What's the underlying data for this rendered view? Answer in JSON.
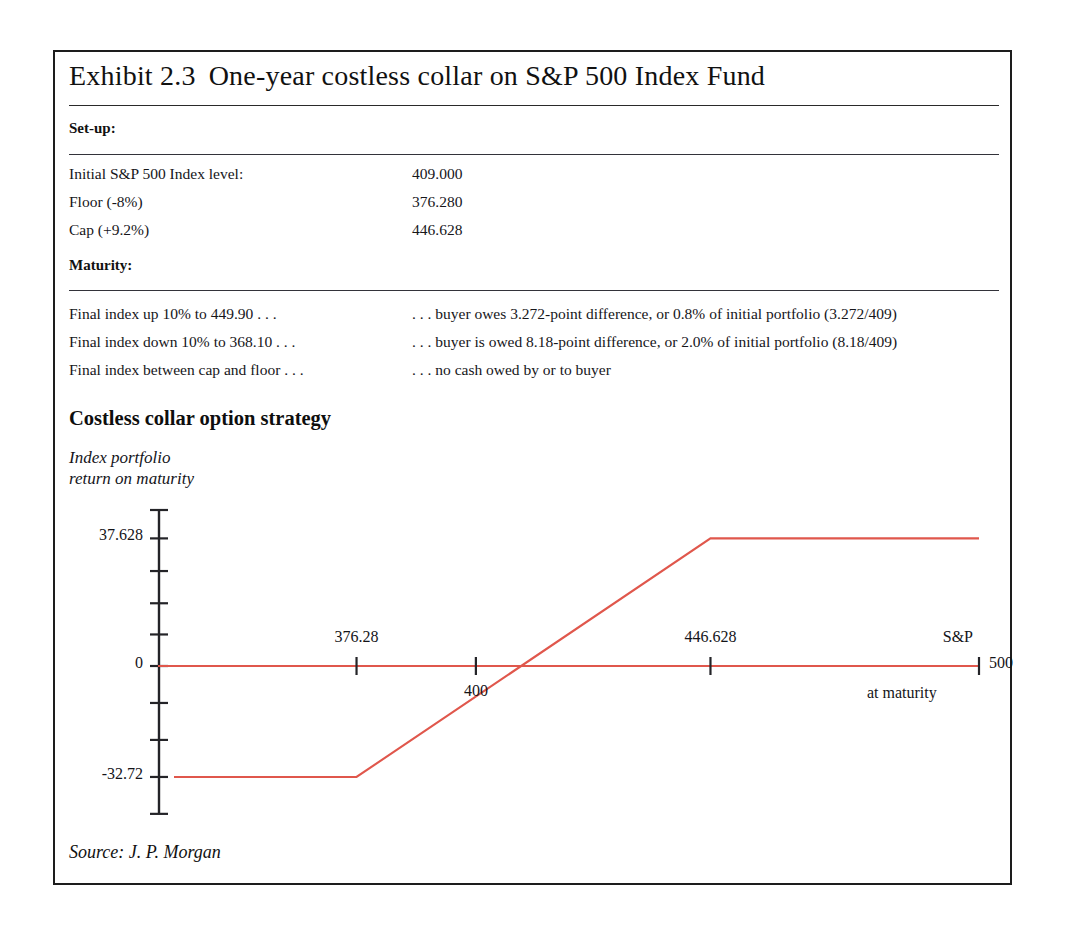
{
  "exhibit": {
    "title_number": "Exhibit 2.3",
    "title_text": "One-year costless collar on S&P 500 Index Fund",
    "source": "Source: J. P. Morgan"
  },
  "setup": {
    "header": "Set-up:",
    "rows": [
      {
        "label": "Initial S&P 500 Index level:",
        "value": "409.000"
      },
      {
        "label": "Floor (-8%)",
        "value": "376.280"
      },
      {
        "label": "Cap (+9.2%)",
        "value": "446.628"
      }
    ]
  },
  "maturity": {
    "header": "Maturity:",
    "rows": [
      {
        "label": "Final index up 10% to 449.90 . . .",
        "value": ". . . buyer owes 3.272-point difference, or 0.8% of initial portfolio (3.272/409)"
      },
      {
        "label": "Final index down 10% to 368.10 . . .",
        "value": ". . . buyer is owed 8.18-point difference, or 2.0% of initial portfolio (8.18/409)"
      },
      {
        "label": "Final index between cap and floor . . .",
        "value": ". . . no cash owed by or to buyer"
      }
    ]
  },
  "chart_data": {
    "type": "line",
    "title": "Costless collar option strategy",
    "ylabel": "Index portfolio\nreturn on maturity",
    "xlabel_lines": [
      "S&P",
      "500",
      "at maturity"
    ],
    "xlabel_tick_value": "500",
    "line_color": "#e0574c",
    "grid": false,
    "legend": null,
    "x": [
      340.0,
      376.28,
      446.628,
      500.0
    ],
    "y": [
      -32.72,
      -32.72,
      37.628,
      37.628
    ],
    "xlim": [
      340.0,
      500.0
    ],
    "ylim": [
      -46.0,
      46.0
    ],
    "x_ticks": [
      {
        "value": 376.28,
        "label": "376.28",
        "label_position": "above"
      },
      {
        "value": 400.0,
        "label": "400",
        "label_position": "below"
      },
      {
        "value": 446.628,
        "label": "446.628",
        "label_position": "above"
      },
      {
        "value": 500.0,
        "label": "500",
        "label_position": "right"
      }
    ],
    "y_ticks": [
      {
        "value": 46.0,
        "label": ""
      },
      {
        "value": 37.628,
        "label": "37.628"
      },
      {
        "value": 28.0,
        "label": ""
      },
      {
        "value": 18.5,
        "label": ""
      },
      {
        "value": 9.3,
        "label": ""
      },
      {
        "value": 0.0,
        "label": "0"
      },
      {
        "value": -10.9,
        "label": ""
      },
      {
        "value": -21.8,
        "label": ""
      },
      {
        "value": -32.72,
        "label": "-32.72"
      },
      {
        "value": -43.6,
        "label": ""
      }
    ],
    "annotations": [
      {
        "text": "37.628",
        "meaning": "cap payoff (maximum return)"
      },
      {
        "text": "0",
        "meaning": "zero return level"
      },
      {
        "text": "-32.72",
        "meaning": "floor payoff (maximum loss)"
      }
    ]
  }
}
